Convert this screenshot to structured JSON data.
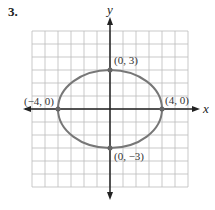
{
  "problem_number": "3.",
  "chart_data": {
    "type": "line",
    "title": "",
    "xlabel": "x",
    "ylabel": "y",
    "xlim": [
      -6,
      6
    ],
    "ylim": [
      -6,
      6
    ],
    "grid": true,
    "curve": {
      "shape": "ellipse",
      "center": [
        0,
        0
      ],
      "a": 4,
      "b": 3
    },
    "points": [
      {
        "x": 0,
        "y": 3,
        "label": "(0, 3)"
      },
      {
        "x": 4,
        "y": 0,
        "label": "(4, 0)"
      },
      {
        "x": -4,
        "y": 0,
        "label": "(−4, 0)"
      },
      {
        "x": 0,
        "y": -3,
        "label": "(0, −3)"
      }
    ]
  }
}
